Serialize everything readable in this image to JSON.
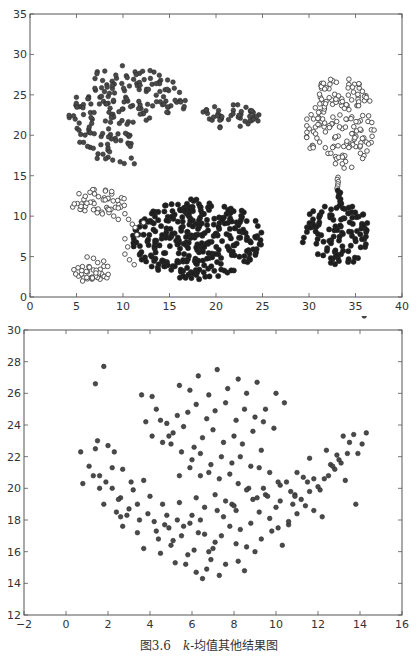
{
  "caption": {
    "figure_number": "图3.6",
    "text_k": "k",
    "text_rest": "-均值其他结果图"
  },
  "colors": {
    "frame": "#555555",
    "dark_marker": "#333333",
    "grey_marker": "#555555",
    "open_marker_edge": "#444444",
    "text": "#333333"
  },
  "chart_data": [
    {
      "type": "scatter",
      "title": "",
      "xlabel": "",
      "ylabel": "",
      "xlim": [
        0,
        40
      ],
      "ylim": [
        0,
        35
      ],
      "xticks": [
        0,
        5,
        10,
        15,
        20,
        25,
        30,
        35,
        40
      ],
      "yticks": [
        0,
        5,
        10,
        15,
        20,
        25,
        30,
        35
      ],
      "grid": false,
      "legend": null,
      "frame_px": {
        "left": 30,
        "top": 14,
        "right": 402,
        "bottom": 297
      },
      "series": [
        {
          "name": "cluster-crescent-upper-left",
          "style": "grey-filled",
          "shape": "crescent",
          "center": [
            10.5,
            22.5
          ],
          "rx": 6.5,
          "ry": 6.2,
          "count": 190,
          "seed": 11
        },
        {
          "name": "cluster-small-upper-middle",
          "style": "grey-filled",
          "shape": "ellipse",
          "center": [
            21.5,
            22.3
          ],
          "rx": 3.2,
          "ry": 1.6,
          "count": 45,
          "seed": 23
        },
        {
          "name": "cluster-upper-right-open",
          "style": "open",
          "shape": "ellipse",
          "center": [
            33.3,
            21.5
          ],
          "rx": 3.8,
          "ry": 5.8,
          "count": 165,
          "seed": 37
        },
        {
          "name": "cluster-lower-right-dark",
          "style": "dark-filled",
          "shape": "ellipse",
          "center": [
            33.0,
            7.8
          ],
          "rx": 3.8,
          "ry": 4.0,
          "count": 110,
          "seed": 41
        },
        {
          "name": "bridge-right",
          "style": "mixed",
          "shape": "line",
          "from": [
            33.0,
            14.8
          ],
          "to": [
            33.4,
            11.3
          ],
          "count": 14,
          "seed": 5
        },
        {
          "name": "cluster-large-lower-middle-dark",
          "style": "dark-filled",
          "shape": "ellipse",
          "center": [
            18.0,
            7.2
          ],
          "rx": 7.0,
          "ry": 5.0,
          "count": 330,
          "seed": 53
        },
        {
          "name": "cluster-small-left-open-upper",
          "style": "open",
          "shape": "ellipse",
          "center": [
            7.3,
            11.8
          ],
          "rx": 3.0,
          "ry": 1.6,
          "count": 48,
          "seed": 61
        },
        {
          "name": "arc-left-open",
          "style": "open",
          "shape": "arc",
          "points": [
            [
              9.0,
              10.0
            ],
            [
              9.5,
              9.6
            ],
            [
              10.2,
              10.3
            ],
            [
              10.6,
              9.6
            ],
            [
              11.0,
              9.0
            ],
            [
              10.2,
              7.2
            ],
            [
              10.5,
              6.2
            ],
            [
              10.2,
              5.3
            ],
            [
              10.7,
              4.6
            ],
            [
              11.2,
              4.0
            ],
            [
              11.5,
              7.7
            ],
            [
              11.3,
              8.6
            ],
            [
              12.2,
              9.2
            ],
            [
              8.5,
              10.8
            ],
            [
              9.5,
              11.0
            ]
          ]
        },
        {
          "name": "cluster-small-lower-left-open",
          "style": "open",
          "shape": "ellipse",
          "center": [
            6.6,
            3.3
          ],
          "rx": 2.0,
          "ry": 1.7,
          "count": 42,
          "seed": 71
        }
      ]
    },
    {
      "type": "scatter",
      "title": "",
      "xlabel": "",
      "ylabel": "",
      "xlim": [
        -2,
        16
      ],
      "ylim": [
        12,
        30
      ],
      "xticks": [
        -2,
        0,
        2,
        4,
        6,
        8,
        10,
        12,
        14,
        16
      ],
      "yticks": [
        12,
        14,
        16,
        18,
        20,
        22,
        24,
        26,
        28,
        30
      ],
      "grid": false,
      "legend": null,
      "frame_px": {
        "left": 24,
        "top": 330,
        "right": 402,
        "bottom": 615
      },
      "series": [
        {
          "name": "points",
          "style": "grey-filled",
          "x": [
            1.8,
            1.4,
            0.7,
            1.1,
            1.5,
            1.4,
            1.6,
            2.0,
            2.3,
            2.2,
            2.7,
            1.9,
            0.8,
            1.6,
            2.6,
            3.1,
            2.2,
            1.3,
            1.8,
            2.6,
            2.5,
            3.0,
            3.4,
            3.2,
            3.7,
            2.4,
            2.7,
            3.5,
            4.0,
            2.9,
            3.4,
            3.9,
            4.2,
            4.6,
            3.7,
            4.3,
            4.8,
            4.4,
            5.0,
            5.3,
            5.6,
            5.2,
            4.5,
            4.9,
            5.8,
            5.4,
            6.0,
            6.3,
            6.6,
            6.1,
            5.7,
            6.8,
            6.2,
            6.5,
            6.9,
            7.1,
            6.7,
            7.3,
            7.6,
            7.0,
            7.4,
            7.8,
            8.1,
            7.5,
            7.9,
            8.3,
            8.6,
            8.2,
            8.8,
            9.2,
            8.5,
            9.0,
            9.5,
            9.8,
            9.3,
            10.0,
            10.3,
            9.7,
            10.6,
            10.9,
            10.2,
            11.2,
            11.5,
            10.8,
            11.8,
            12.1,
            11.3,
            12.5,
            12.8,
            12.0,
            13.1,
            13.4,
            12.6,
            13.7,
            14.1,
            13.2,
            14.3,
            13.9,
            12.9,
            11.6,
            11.0,
            10.5,
            9.4,
            8.9,
            8.0,
            7.2,
            6.4,
            5.9,
            5.5,
            5.1,
            4.7,
            4.1,
            3.8,
            3.6,
            4.1,
            4.5,
            4.9,
            5.4,
            5.9,
            6.3,
            6.8,
            7.2,
            7.7,
            8.2,
            8.6,
            9.1,
            9.5,
            10.0,
            10.4,
            4.3,
            4.8,
            5.3,
            5.8,
            6.2,
            6.7,
            7.1,
            7.6,
            8.1,
            8.5,
            9.0,
            9.4,
            9.9,
            4.6,
            5.1,
            5.6,
            6.1,
            6.5,
            7.0,
            7.5,
            8.0,
            8.4,
            8.9,
            9.3,
            5.0,
            5.5,
            6.0,
            6.4,
            6.9,
            7.4,
            7.9,
            8.3,
            8.8,
            9.2,
            5.4,
            5.9,
            6.4,
            6.8,
            7.3,
            7.8,
            8.2,
            8.7,
            9.6,
            10.1,
            10.7,
            6.2,
            6.6,
            7.1,
            7.6,
            8.1,
            8.6,
            9.1,
            10.2,
            10.9,
            11.6,
            12.3,
            13.0,
            12.7,
            13.3,
            13.8,
            12.2,
            11.8,
            11.4,
            11.0,
            10.6,
            10.1,
            9.7,
            12.4,
            13.5,
            14.2
          ],
          "y": [
            27.7,
            26.6,
            22.3,
            21.4,
            23.0,
            22.5,
            20.8,
            22.7,
            22.3,
            21.3,
            21.2,
            20.4,
            20.3,
            20.0,
            19.4,
            20.4,
            20.0,
            20.8,
            19.0,
            18.2,
            19.3,
            18.7,
            19.0,
            19.9,
            20.5,
            18.5,
            17.6,
            18.0,
            19.5,
            18.3,
            17.2,
            18.4,
            17.9,
            19.0,
            16.2,
            17.3,
            18.3,
            16.8,
            16.4,
            18.0,
            17.6,
            15.3,
            15.9,
            17.5,
            15.8,
            19.1,
            18.3,
            17.2,
            17.1,
            16.1,
            15.2,
            16.0,
            14.7,
            14.3,
            15.5,
            16.6,
            14.9,
            14.5,
            15.2,
            16.2,
            17.0,
            17.6,
            16.5,
            18.2,
            19.0,
            17.4,
            16.3,
            15.4,
            17.8,
            18.5,
            14.8,
            16.0,
            19.6,
            17.3,
            16.8,
            18.8,
            16.4,
            18.1,
            17.7,
            19.6,
            20.2,
            19.3,
            20.4,
            19.0,
            20.6,
            19.9,
            20.7,
            20.8,
            21.2,
            20.1,
            21.6,
            22.2,
            21.5,
            23.4,
            22.8,
            23.3,
            23.5,
            22.2,
            22.1,
            21.9,
            21.0,
            20.4,
            20.0,
            19.3,
            18.9,
            18.6,
            18.0,
            17.8,
            17.0,
            16.7,
            17.7,
            23.3,
            24.2,
            25.9,
            25.8,
            24.3,
            23.3,
            26.5,
            26.2,
            27.1,
            25.9,
            27.5,
            26.3,
            26.9,
            26.0,
            26.7,
            25.0,
            26.0,
            25.4,
            25.0,
            24.1,
            24.6,
            24.8,
            25.3,
            24.4,
            24.9,
            25.4,
            24.3,
            25.0,
            24.5,
            24.2,
            23.8,
            22.9,
            23.5,
            23.9,
            22.6,
            23.2,
            23.7,
            22.9,
            23.3,
            22.8,
            23.6,
            22.4,
            22.8,
            22.3,
            21.8,
            22.2,
            21.5,
            22.0,
            21.6,
            22.0,
            21.4,
            21.3,
            20.8,
            21.3,
            20.8,
            21.0,
            20.6,
            20.9,
            20.3,
            20.0,
            19.5,
            20.4,
            19.8,
            19.4,
            18.8,
            19.6,
            19.2,
            18.6,
            19.9,
            19.4,
            19.2,
            19.5,
            19.8,
            20.6,
            21.8,
            21.4,
            20.5,
            19.0,
            18.2,
            18.6,
            18.9,
            18.4,
            17.9,
            17.5,
            21.0,
            22.4,
            22.9
          ]
        }
      ]
    }
  ]
}
